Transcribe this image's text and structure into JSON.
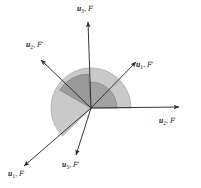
{
  "figure": {
    "name": "frame-rotation-diagram",
    "type": "vector-frame-diagram",
    "width": 201,
    "height": 188,
    "background_color": "#ffffff",
    "origin": {
      "x": 91,
      "y": 108
    },
    "colors": {
      "axis_line": "#2b2b2b",
      "sector_light": "#c9c9c9",
      "sector_mid": "#a8a8a8",
      "sector_dark": "#8f8f8f",
      "sector_stroke": "#6e6e6e",
      "text": "#1a1a1a"
    },
    "frames": [
      {
        "id": "F",
        "symbol": "F",
        "prime": "",
        "description": "reference frame F"
      },
      {
        "id": "Fp",
        "symbol": "F",
        "prime": "'",
        "description": "rotated reference frame F prime"
      }
    ],
    "axes": [
      {
        "id": "u3-F",
        "vector": "u",
        "index": "3",
        "frame": "F",
        "frame_symbol": "F",
        "prime": "",
        "label_text": "u3, F",
        "tip": {
          "x": 88,
          "y": 20
        },
        "arrow": true
      },
      {
        "id": "u2-F",
        "vector": "u",
        "index": "2",
        "frame": "F",
        "frame_symbol": "F",
        "prime": "",
        "label_text": "u2, F",
        "tip": {
          "x": 181,
          "y": 107
        },
        "arrow": true
      },
      {
        "id": "u1-F",
        "vector": "u",
        "index": "1",
        "frame": "F",
        "frame_symbol": "F",
        "prime": "",
        "label_text": "u1, F",
        "tip": {
          "x": 22,
          "y": 168
        },
        "arrow": true
      },
      {
        "id": "u1-Fp",
        "vector": "u",
        "index": "1",
        "frame": "Fp",
        "frame_symbol": "F",
        "prime": "'",
        "label_text": "u1, F'",
        "tip": {
          "x": 137,
          "y": 60
        },
        "arrow": true
      },
      {
        "id": "u2-Fp",
        "vector": "u",
        "index": "2",
        "frame": "Fp",
        "frame_symbol": "F",
        "prime": "'",
        "label_text": "u2, F'",
        "tip": {
          "x": 39,
          "y": 58
        },
        "arrow": true
      },
      {
        "id": "u3-Fp",
        "vector": "u",
        "index": "3",
        "frame": "Fp",
        "frame_symbol": "F",
        "prime": "'",
        "label_text": "u3, F'",
        "tip": {
          "x": 76,
          "y": 157
        },
        "arrow": true
      }
    ],
    "sectors": [
      {
        "id": "sector-large-light",
        "fill": "#c9c9c9",
        "radius": 40,
        "from_axis": "u2-F",
        "to_axis": "u1-F",
        "description": "large light sector from positive horizontal sweeping counterclockwise to lower-left axis"
      },
      {
        "id": "sector-upper-dark",
        "fill": "#9a9a9a",
        "radius": 34,
        "from_axis": "u3-F",
        "to_axis": "u2-Fp",
        "description": "darker sector between vertical axis and upper-left axis"
      },
      {
        "id": "sector-right-mid",
        "fill": "#a0a0a0",
        "radius": 26,
        "from_axis": "u2-F",
        "to_axis": "u3-F",
        "description": "mid-gray sector between horizontal axis and vertical axis"
      }
    ]
  }
}
